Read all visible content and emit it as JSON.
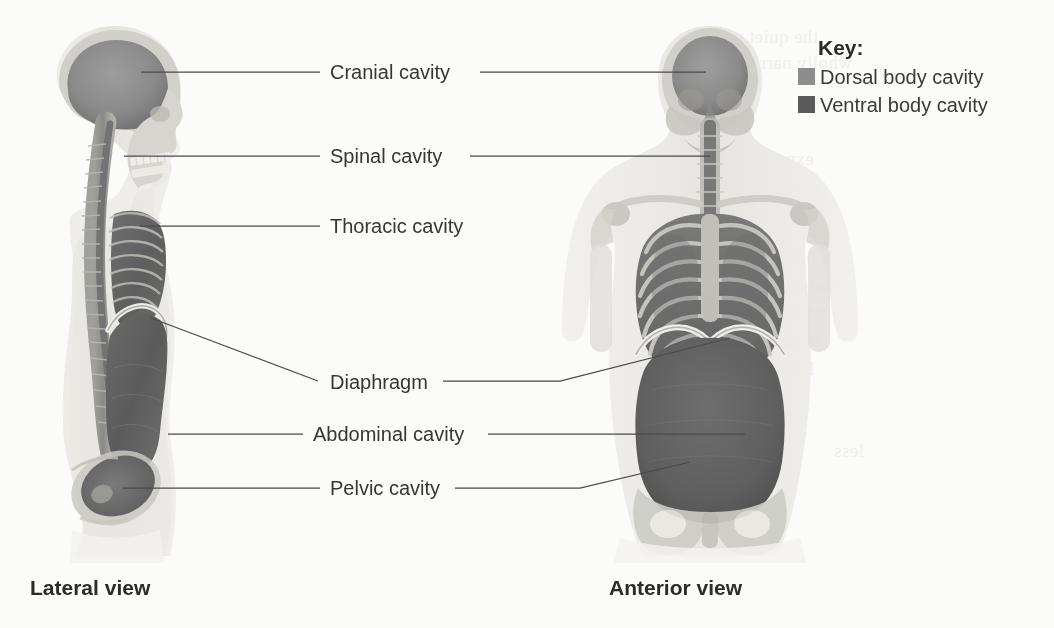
{
  "figure": {
    "labels": [
      {
        "id": "cranial",
        "text": "Cranial cavity",
        "x": 330,
        "y": 62
      },
      {
        "id": "spinal",
        "text": "Spinal cavity",
        "x": 330,
        "y": 146
      },
      {
        "id": "thoracic",
        "text": "Thoracic cavity",
        "x": 330,
        "y": 216
      },
      {
        "id": "diaphragm",
        "text": "Diaphragm",
        "x": 330,
        "y": 372
      },
      {
        "id": "abdominal",
        "text": "Abdominal cavity",
        "x": 313,
        "y": 424
      },
      {
        "id": "pelvic",
        "text": "Pelvic cavity",
        "x": 330,
        "y": 478
      }
    ],
    "captions": {
      "lateral": "Lateral view",
      "anterior": "Anterior view"
    }
  },
  "key": {
    "title": "Key:",
    "items": [
      {
        "label": "Dorsal body cavity",
        "color": "#8d8d8d"
      },
      {
        "label": "Ventral body cavity",
        "color": "#5a5a5a"
      }
    ]
  },
  "colors": {
    "background": "#fbfbf9",
    "leader_line": "#4a4a4a",
    "label_text": "#363636",
    "dorsal_cavity": "#8d8d8d",
    "ventral_cavity": "#5a5a5a",
    "body_outline": "#e3e2dd",
    "bone": "#c9c8c2"
  },
  "ghost_text": [
    {
      "text": "the quiet problem",
      "x": 14,
      "y": 26
    },
    {
      "text": "wholly narrow",
      "x": 48,
      "y": 52
    },
    {
      "text": "experienced to",
      "x": 10,
      "y": 148
    },
    {
      "text": "spinal cord levels",
      "x": 18,
      "y": 176
    },
    {
      "text": "other person, that",
      "x": 12,
      "y": 246
    },
    {
      "text": "described in",
      "x": 30,
      "y": 274
    },
    {
      "text": "palliative reform",
      "x": 22,
      "y": 302
    },
    {
      "text": "make is and most",
      "x": 16,
      "y": 330
    },
    {
      "text": "has the level public",
      "x": 10,
      "y": 358
    },
    {
      "text": "less",
      "x": 60,
      "y": 440
    }
  ]
}
